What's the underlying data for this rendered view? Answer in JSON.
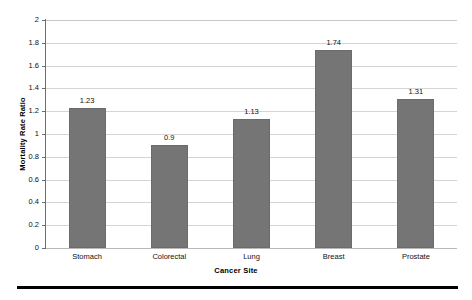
{
  "chart_data": {
    "type": "bar",
    "title": "",
    "subtitle": "",
    "xlabel": "Cancer Site",
    "ylabel": "Mortality Rate Ratio",
    "categories": [
      "Stomach",
      "Colorectal",
      "Lung",
      "Breast",
      "Prostate"
    ],
    "values": [
      1.23,
      0.9,
      1.13,
      1.74,
      1.31
    ],
    "value_labels": [
      "1.23",
      "0.9",
      "1.13",
      "1.74",
      "1.31"
    ],
    "ylim": [
      0,
      2
    ],
    "ytick_step": 0.2,
    "ytick_labels": [
      "0",
      "0.2",
      "0.4",
      "0.6",
      "0.8",
      "1",
      "1.2",
      "1.4",
      "1.6",
      "1.8",
      "2"
    ],
    "ytick_values": [
      0,
      0.2,
      0.4,
      0.6,
      0.8,
      1,
      1.2,
      1.4,
      1.6,
      1.8,
      2
    ],
    "grid": true,
    "grid_axis": "y",
    "legend": false,
    "legend_position": "none",
    "bar_color": "#757575",
    "bar_border_color": "#6b6b6b",
    "gridline_color": "#d4d4d4",
    "axis_color": "#6e6e6e",
    "text_color": "#111111",
    "background_color": "#ffffff",
    "show_value_labels": true
  },
  "decorations": {
    "bottom_rule_color": "#000000"
  }
}
